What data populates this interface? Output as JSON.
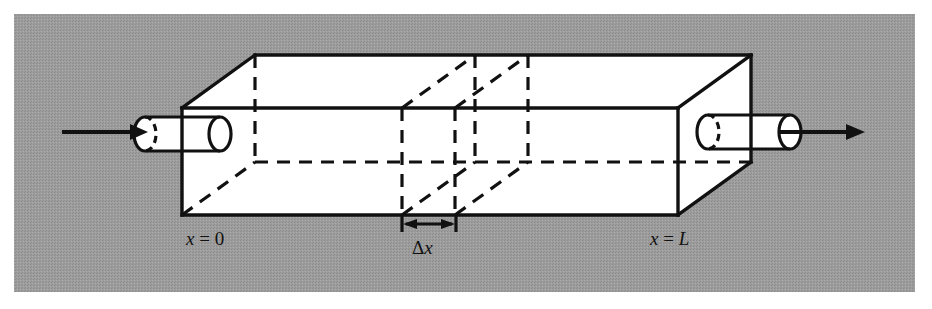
{
  "figure": {
    "name": "one-dimensional-rod-with-control-volume",
    "type": "technical-line-diagram",
    "background_color": "#9a9a9a",
    "page_color": "#ffffff",
    "ink_color": "#111111",
    "face_fill": "#ffffff"
  },
  "labels": {
    "left_end": {
      "var": "x",
      "eq": " = ",
      "value": "0",
      "text": "x = 0"
    },
    "right_end": {
      "var": "x",
      "eq": " = ",
      "value": "L",
      "text": "x = L"
    },
    "slab_width": {
      "delta": "Δ",
      "var": "x",
      "text": "Δx"
    }
  },
  "annotations": {
    "inlet_arrow": "flow-in-arrow",
    "outlet_arrow": "flow-out-arrow",
    "dimension_arrow": "double-headed-dimension-arrow"
  },
  "geometry": {
    "frame": {
      "x": 14,
      "y": 14,
      "width": 901,
      "height": 278
    },
    "box_front": {
      "left": 182,
      "right": 678,
      "top": 108,
      "bottom": 215
    },
    "depth_offset": {
      "dx": 73,
      "dy": -53
    },
    "slab_front_x": [
      402,
      455
    ],
    "inlet_cylinder": {
      "x1": 145,
      "x2": 220,
      "cy": 134,
      "ry": 17,
      "rx": 11
    },
    "outlet_cylinder": {
      "x1": 708,
      "x2": 790,
      "cy": 132,
      "ry": 17,
      "rx": 11
    },
    "inlet_arrow": {
      "x1": 62,
      "x2": 146,
      "y": 132
    },
    "outlet_arrow": {
      "x1": 785,
      "x2": 864,
      "y": 132
    },
    "dimension_line": {
      "x1": 402,
      "x2": 455,
      "y": 224,
      "tick_top": 215,
      "tick_bottom": 232
    }
  },
  "label_positions": {
    "left_end": {
      "x": 186,
      "y": 243
    },
    "right_end": {
      "x": 650,
      "y": 243
    },
    "slab_width": {
      "x": 413,
      "y": 253
    }
  }
}
